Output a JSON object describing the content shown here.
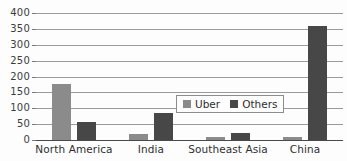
{
  "chart_data": {
    "type": "bar",
    "title": "",
    "xlabel": "",
    "ylabel": "",
    "categories": [
      "North America",
      "India",
      "Southeast Asia",
      "China"
    ],
    "series": [
      {
        "name": "Uber",
        "color": "#8b8b8b",
        "values": [
          175,
          20,
          10,
          8
        ]
      },
      {
        "name": "Others",
        "color": "#474747",
        "values": [
          57,
          85,
          23,
          360
        ]
      }
    ],
    "ylim": [
      0,
      400
    ],
    "yticks": [
      0,
      50,
      100,
      150,
      200,
      250,
      300,
      350,
      400
    ],
    "ytick_labels": [
      "0",
      "50",
      "100",
      "150",
      "200",
      "250",
      "300",
      "350",
      "400"
    ],
    "grid": true,
    "legend_position": "center-right",
    "legend_entries": [
      "Uber",
      "Others"
    ],
    "annotations": []
  },
  "colors": {
    "uber": "#8b8b8b",
    "others": "#474747",
    "gridline": "#9a9a9a",
    "axis": "#4a4a4a",
    "text": "#2f2f2f",
    "background": "#fdfdfd"
  }
}
